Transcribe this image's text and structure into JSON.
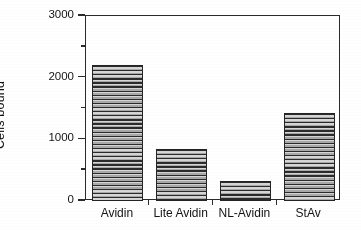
{
  "chart_data": {
    "type": "bar",
    "title": "",
    "subtitle": "",
    "xlabel": "",
    "ylabel": "Cells bound",
    "categories": [
      "Avidin",
      "Lite Avidin",
      "NL-Avidin",
      "StAv"
    ],
    "values": [
      2200,
      840,
      330,
      1420
    ],
    "series": [
      {
        "name": "Cells bound",
        "values": [
          2200,
          840,
          330,
          1420
        ]
      }
    ],
    "ylim": [
      0,
      3000
    ],
    "ytick_labels": [
      "0",
      "1000",
      "2000",
      "3000"
    ],
    "ytick_values": [
      0,
      1000,
      2000,
      3000
    ],
    "yminor_tick_values": [
      500,
      1500,
      2500
    ],
    "grid": false,
    "legend": null,
    "legend_position": "none",
    "bar_fill": "horizontal-line-hatch",
    "annotations": []
  },
  "axes": {
    "y_title": "Cells bound",
    "y_ticks": [
      {
        "label": "3000",
        "value": 3000
      },
      {
        "label": "2000",
        "value": 2000
      },
      {
        "label": "1000",
        "value": 1000
      },
      {
        "label": "0",
        "value": 0
      }
    ],
    "x_ticks": [
      "Avidin",
      "Lite Avidin",
      "NL-Avidin",
      "StAv"
    ]
  },
  "bars": [
    {
      "label": "Avidin",
      "value": 2200
    },
    {
      "label": "Lite Avidin",
      "value": 840
    },
    {
      "label": "NL-Avidin",
      "value": 330
    },
    {
      "label": "StAv",
      "value": 1420
    }
  ],
  "colors": {
    "axis": "#2a2a2a",
    "text": "#141414",
    "bar_outline": "#242424",
    "bar_fill_light": "#d6d6d6",
    "bar_fill_dark": "#2b2b2b",
    "background": "#ffffff"
  }
}
